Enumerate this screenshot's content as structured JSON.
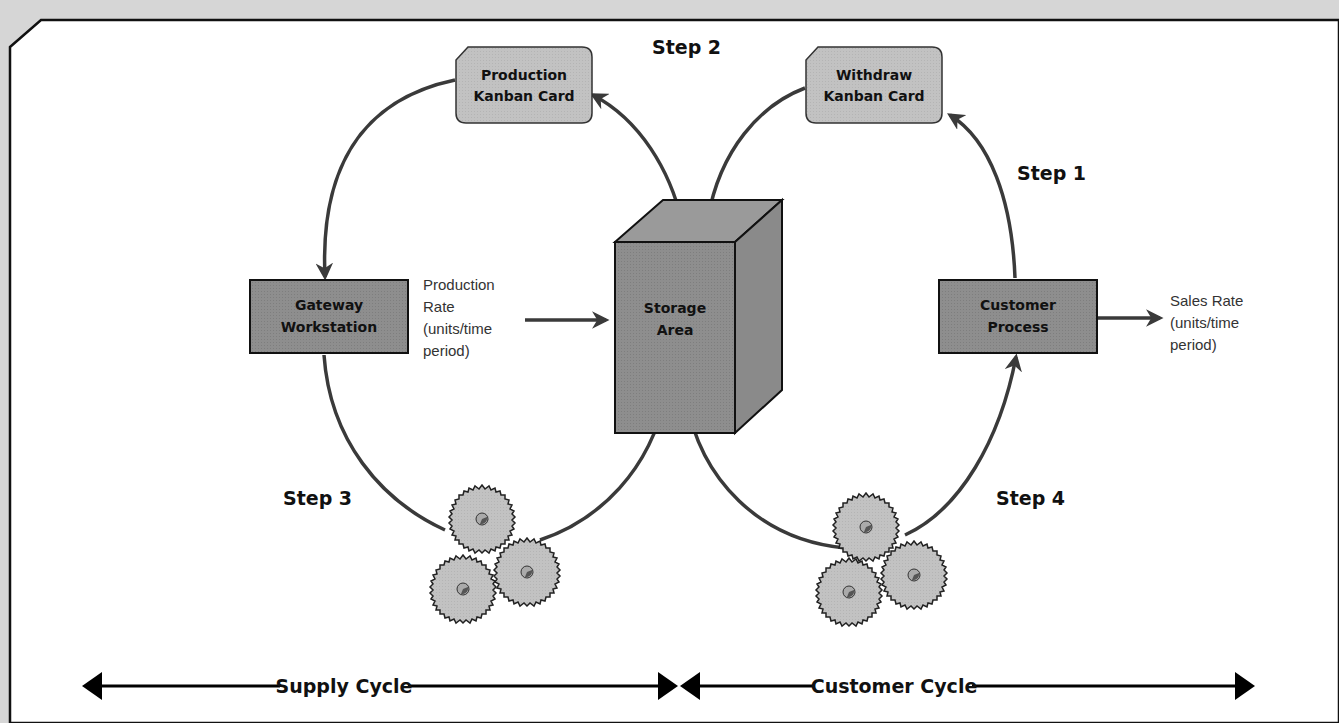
{
  "diagram": {
    "colors": {
      "background": "#d6d6d6",
      "panel": "#ffffff",
      "box_fill": "#8c8c8c",
      "card_fill": "#bdbdbd",
      "line": "#3a3a3a",
      "text": "#111111"
    },
    "cards": {
      "production": {
        "line1": "Production",
        "line2": "Kanban Card"
      },
      "withdraw": {
        "line1": "Withdraw",
        "line2": "Kanban Card"
      }
    },
    "boxes": {
      "gateway": {
        "line1": "Gateway",
        "line2": "Workstation"
      },
      "storage": {
        "line1": "Storage",
        "line2": "Area"
      },
      "customer": {
        "line1": "Customer",
        "line2": "Process"
      }
    },
    "steps": {
      "step1": "Step 1",
      "step2": "Step 2",
      "step3": "Step 3",
      "step4": "Step 4"
    },
    "rates": {
      "production": {
        "line1": "Production",
        "line2": "Rate",
        "line3": "(units/time",
        "line4": "period)"
      },
      "sales": {
        "line1": "Sales Rate",
        "line2": "(units/time",
        "line3": "period)"
      }
    },
    "cycles": {
      "supply": "Supply Cycle",
      "customer": "Customer Cycle"
    },
    "icons": {
      "gears_left": "gears-icon",
      "gears_right": "gears-icon"
    }
  }
}
